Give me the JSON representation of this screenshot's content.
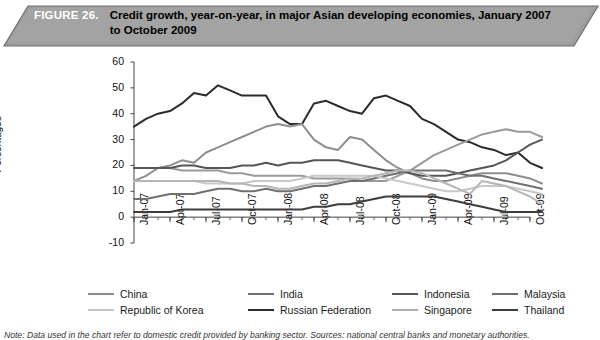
{
  "figure": {
    "number_label": "FIGURE 26.",
    "title": "Credit growth, year-on-year, in major Asian developing economies, January 2007 to October 2009"
  },
  "note": {
    "text": "Note: Data used in the chart refer to domestic credit provided by banking sector. Sources: national central banks and monetary authorities."
  },
  "legend": {
    "items": [
      {
        "label": "China",
        "color": "#8c8c8c",
        "col": 0,
        "row": 0
      },
      {
        "label": "Republic of Korea",
        "color": "#c6c6c6",
        "col": 0,
        "row": 1
      },
      {
        "label": "India",
        "color": "#6e6e6e",
        "col": 1,
        "row": 0
      },
      {
        "label": "Russian Federation",
        "color": "#2b2b2b",
        "col": 1,
        "row": 1
      },
      {
        "label": "Indonesia",
        "color": "#595959",
        "col": 2,
        "row": 0
      },
      {
        "label": "Singapore",
        "color": "#b0b0b0",
        "col": 2,
        "row": 1
      },
      {
        "label": "Malaysia",
        "color": "#6e6e6e",
        "col": 3,
        "row": 0
      },
      {
        "label": "Thailand",
        "color": "#3d3d3d",
        "col": 3,
        "row": 1
      }
    ]
  },
  "chart_data": {
    "type": "line",
    "title": "Credit growth, year-on-year, in major Asian developing economies, January 2007 to October 2009",
    "xlabel": "",
    "ylabel": "Percentages",
    "ylim": [
      -10,
      60
    ],
    "ytick_values": [
      -10,
      0,
      10,
      20,
      30,
      40,
      50,
      60
    ],
    "ytick_labels": [
      "-10",
      "0",
      "10",
      "20",
      "30",
      "40",
      "50",
      "60"
    ],
    "grid": false,
    "legend_position": "bottom",
    "x_major_labels": [
      "Jan-07",
      "Apr-07",
      "Jul-07",
      "Oct-07",
      "Jan-08",
      "Apr-08",
      "Jul-08",
      "Oct-08",
      "Jan-09",
      "Apr-09",
      "Jul-09",
      "Oct-09"
    ],
    "x_months": [
      "Jan-07",
      "Feb-07",
      "Mar-07",
      "Apr-07",
      "May-07",
      "Jun-07",
      "Jul-07",
      "Aug-07",
      "Sep-07",
      "Oct-07",
      "Nov-07",
      "Dec-07",
      "Jan-08",
      "Feb-08",
      "Mar-08",
      "Apr-08",
      "May-08",
      "Jun-08",
      "Jul-08",
      "Aug-08",
      "Sep-08",
      "Oct-08",
      "Nov-08",
      "Dec-08",
      "Jan-09",
      "Feb-09",
      "Mar-09",
      "Apr-09",
      "May-09",
      "Jun-09",
      "Jul-09",
      "Aug-09",
      "Sep-09",
      "Oct-09"
    ],
    "series": [
      {
        "name": "Russian Federation",
        "color": "#2b2b2b",
        "width": 2.0,
        "values": [
          35,
          38,
          40,
          41,
          44,
          48,
          47,
          51,
          49,
          47,
          47,
          47,
          39,
          36,
          36,
          44,
          45,
          43,
          41,
          40,
          46,
          47,
          45,
          43,
          38,
          36,
          33,
          30,
          29,
          27,
          26,
          24,
          25,
          21,
          19
        ]
      },
      {
        "name": "India",
        "color": "#8e8e8e",
        "width": 2.0,
        "values": [
          14,
          16,
          19,
          20,
          22,
          21,
          25,
          27,
          29,
          31,
          33,
          35,
          36,
          35,
          36,
          30,
          27,
          26,
          31,
          30,
          26,
          22,
          19,
          17,
          15,
          14,
          14,
          15,
          16,
          17,
          17,
          17,
          16,
          15,
          13
        ]
      },
      {
        "name": "China",
        "color": "#9a9a9a",
        "width": 2.0,
        "values": [
          19,
          19,
          19,
          19,
          18,
          18,
          18,
          18,
          17,
          17,
          16,
          16,
          16,
          16,
          16,
          15,
          15,
          15,
          15,
          14,
          14,
          14,
          16,
          18,
          21,
          24,
          26,
          28,
          30,
          32,
          33,
          34,
          33,
          33,
          31
        ]
      },
      {
        "name": "Indonesia",
        "color": "#565656",
        "width": 2.0,
        "values": [
          19,
          19,
          19,
          19,
          20,
          20,
          19,
          19,
          19,
          20,
          20,
          21,
          20,
          21,
          21,
          22,
          22,
          22,
          21,
          20,
          19,
          18,
          18,
          17,
          16,
          16,
          16,
          17,
          18,
          19,
          20,
          22,
          25,
          28,
          30
        ]
      },
      {
        "name": "Malaysia",
        "color": "#707070",
        "width": 2.0,
        "values": [
          7,
          7,
          8,
          9,
          9,
          9,
          10,
          11,
          11,
          10,
          10,
          11,
          10,
          10,
          11,
          12,
          12,
          13,
          14,
          14,
          15,
          16,
          17,
          18,
          18,
          18,
          18,
          17,
          16,
          16,
          15,
          14,
          13,
          12,
          11
        ]
      },
      {
        "name": "Republic of Korea",
        "color": "#c8c8c8",
        "width": 2.0,
        "values": [
          14,
          14,
          14,
          14,
          14,
          14,
          13,
          13,
          13,
          13,
          14,
          14,
          14,
          14,
          15,
          16,
          16,
          16,
          16,
          16,
          16,
          15,
          14,
          13,
          12,
          11,
          10,
          10,
          11,
          12,
          12,
          12,
          11,
          10,
          9
        ]
      },
      {
        "name": "Singapore",
        "color": "#b5b5b5",
        "width": 2.0,
        "values": [
          14,
          14,
          14,
          14,
          14,
          14,
          14,
          14,
          13,
          13,
          12,
          12,
          11,
          11,
          12,
          13,
          13,
          14,
          15,
          15,
          16,
          17,
          18,
          18,
          17,
          15,
          13,
          11,
          9,
          14,
          13,
          12,
          10,
          8,
          5
        ]
      },
      {
        "name": "Thailand",
        "color": "#3d3d3d",
        "width": 2.0,
        "values": [
          2,
          2,
          2,
          2,
          3,
          3,
          3,
          3,
          3,
          3,
          3,
          3,
          3,
          3,
          3,
          4,
          4,
          5,
          5,
          6,
          7,
          8,
          8,
          8,
          8,
          8,
          7,
          6,
          5,
          4,
          3,
          2,
          2,
          2,
          2
        ]
      }
    ]
  }
}
